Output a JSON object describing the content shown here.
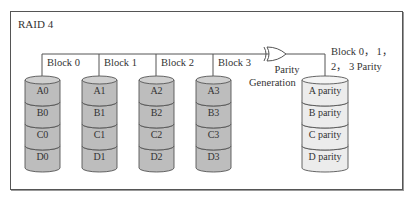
{
  "title": "RAID 4",
  "colors": {
    "data_disk_fill": "#bdbdbd",
    "data_disk_top": "#cfcfcf",
    "parity_disk_fill": "#ececec",
    "parity_disk_top": "#f4f4f4",
    "stroke": "#555555"
  },
  "disks": [
    {
      "block_label": "Block 0",
      "segments": [
        "A0",
        "B0",
        "C0",
        "D0"
      ],
      "type": "data"
    },
    {
      "block_label": "Block 1",
      "segments": [
        "A1",
        "B1",
        "C1",
        "D1"
      ],
      "type": "data"
    },
    {
      "block_label": "Block 2",
      "segments": [
        "A2",
        "B2",
        "C2",
        "D2"
      ],
      "type": "data"
    },
    {
      "block_label": "Block 3",
      "segments": [
        "A3",
        "B3",
        "C3",
        "D3"
      ],
      "type": "data"
    }
  ],
  "parity_gate": {
    "label_line1": "Parity",
    "label_line2": "Generation"
  },
  "parity_disk": {
    "label_line1": "Block 0， 1，",
    "label_line2": "2， 3 Parity",
    "segments": [
      "A parity",
      "B parity",
      "C parity",
      "D parity"
    ]
  }
}
